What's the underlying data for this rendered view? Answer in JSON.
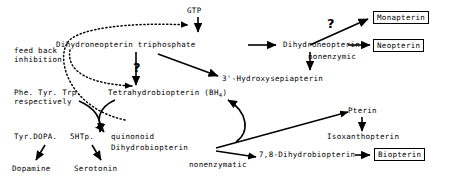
{
  "figure": {
    "kind": "biochemical-pathway-diagram"
  },
  "nodes": {
    "gtp": "GTP",
    "dihydroneopterin_triphosphate": "Dihydroneopterin triphosphate",
    "dihydroneopterin": "Dihydroneopterin",
    "monapterin": "Monapterin",
    "neopterin": "Neopterin",
    "hydroxysepiapterin": "3'-Hydroxysepiapterin",
    "tetrahydrobiopterin": "Tetrahydrobiopterin (BH",
    "tetrahydrobiopterin_sub": "4",
    "tetrahydrobiopterin_close": ")",
    "quinonoid": "quinonoid",
    "dihydrobiopterin": "Dihydrobiopterin",
    "pterin": "Pterin",
    "isoxanthopterin": "Isoxanthopterin",
    "dihydrobiopterin_78": "7,8-Dihydrobiopterin",
    "biopterin": "Biopterin",
    "phe_tyr_trp": "Phe. Tyr. Trp.",
    "respectively": "respectively",
    "tyr_dopa": "Tyr.DOPA.",
    "fivehtp": "5HTp.",
    "dopamine": "Dopamine",
    "serotonin": "Serotonin"
  },
  "annotations": {
    "feed_back": "feed back",
    "inhibition": "inhibition",
    "nonenzymic": "nonenzymic",
    "nonenzymatic": "nonenzymatic",
    "question_upper_left": "?",
    "question_upper_right": "?"
  },
  "colors": {
    "ink": "#000000",
    "background": "#ffffff"
  },
  "boxed_nodes": [
    "Monapterin",
    "Neopterin",
    "Biopterin"
  ]
}
